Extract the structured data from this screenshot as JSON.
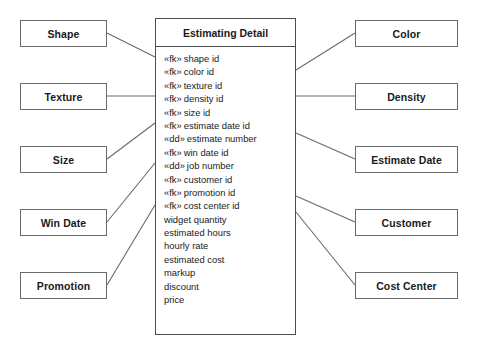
{
  "diagram": {
    "title": "Estimating Detail",
    "central_entity": {
      "name": "Estimating Detail",
      "attributes": [
        {
          "stereotype": "«fk»",
          "name": "shape id"
        },
        {
          "stereotype": "«fk»",
          "name": "color id"
        },
        {
          "stereotype": "«fk»",
          "name": "texture id"
        },
        {
          "stereotype": "«fk»",
          "name": "density id"
        },
        {
          "stereotype": "«fk»",
          "name": "size id"
        },
        {
          "stereotype": "«fk»",
          "name": "estimate date id"
        },
        {
          "stereotype": "«dd»",
          "name": "estimate number"
        },
        {
          "stereotype": "«fk»",
          "name": "win date id"
        },
        {
          "stereotype": "«dd»",
          "name": "job number"
        },
        {
          "stereotype": "«fk»",
          "name": "customer id"
        },
        {
          "stereotype": "«fk»",
          "name": "promotion id"
        },
        {
          "stereotype": "«fk»",
          "name": "cost center id"
        },
        {
          "stereotype": "",
          "name": "widget quantity"
        },
        {
          "stereotype": "",
          "name": "estimated hours"
        },
        {
          "stereotype": "",
          "name": "hourly rate"
        },
        {
          "stereotype": "",
          "name": "estimated cost"
        },
        {
          "stereotype": "",
          "name": "markup"
        },
        {
          "stereotype": "",
          "name": "discount"
        },
        {
          "stereotype": "",
          "name": "price"
        }
      ]
    },
    "left_entities": [
      {
        "name": "Shape"
      },
      {
        "name": "Texture"
      },
      {
        "name": "Size"
      },
      {
        "name": "Win Date"
      },
      {
        "name": "Promotion"
      }
    ],
    "right_entities": [
      {
        "name": "Color"
      },
      {
        "name": "Density"
      },
      {
        "name": "Estimate Date"
      },
      {
        "name": "Customer"
      },
      {
        "name": "Cost Center"
      }
    ],
    "colors": {
      "border": "#6a6a6a",
      "central_border": "#4d4d4d",
      "connector": "#6a6a6a",
      "text": "#1a1a1a",
      "background": "#ffffff"
    }
  }
}
